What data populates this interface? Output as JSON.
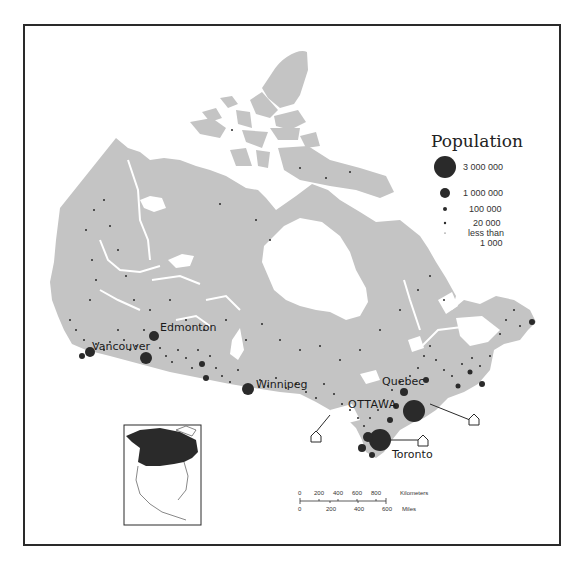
{
  "map": {
    "subject": "Population distribution of Canada",
    "land_color": "#c4c4c4",
    "water_color": "#ffffff",
    "dot_color": "#2a2a2a",
    "frame_color": "#2a2a2a"
  },
  "legend": {
    "title": "Population",
    "items": [
      {
        "label": "3 000 000",
        "radius": 11
      },
      {
        "label": "1 000 000",
        "radius": 5
      },
      {
        "label": "100 000",
        "radius": 2
      },
      {
        "label": "20 000",
        "radius": 1.2
      },
      {
        "label": "less than 1 000",
        "line1": "less than",
        "line2": "1 000",
        "radius": 0.6
      }
    ]
  },
  "cities": {
    "edmonton": "Edmonton",
    "vancouver": "Vancouver",
    "winnipeg": "Winnipeg",
    "quebec": "Quebec",
    "ottawa": "OTTAWA",
    "toronto": "Toronto"
  },
  "scale_bar": {
    "km_label": "Kilometers",
    "km_ticks": [
      "0",
      "200",
      "400",
      "600",
      "800"
    ],
    "mi_label": "Miles",
    "mi_ticks": [
      "0",
      "200",
      "400",
      "600"
    ]
  },
  "inset": {
    "subject": "North America locator map with Canada highlighted"
  }
}
